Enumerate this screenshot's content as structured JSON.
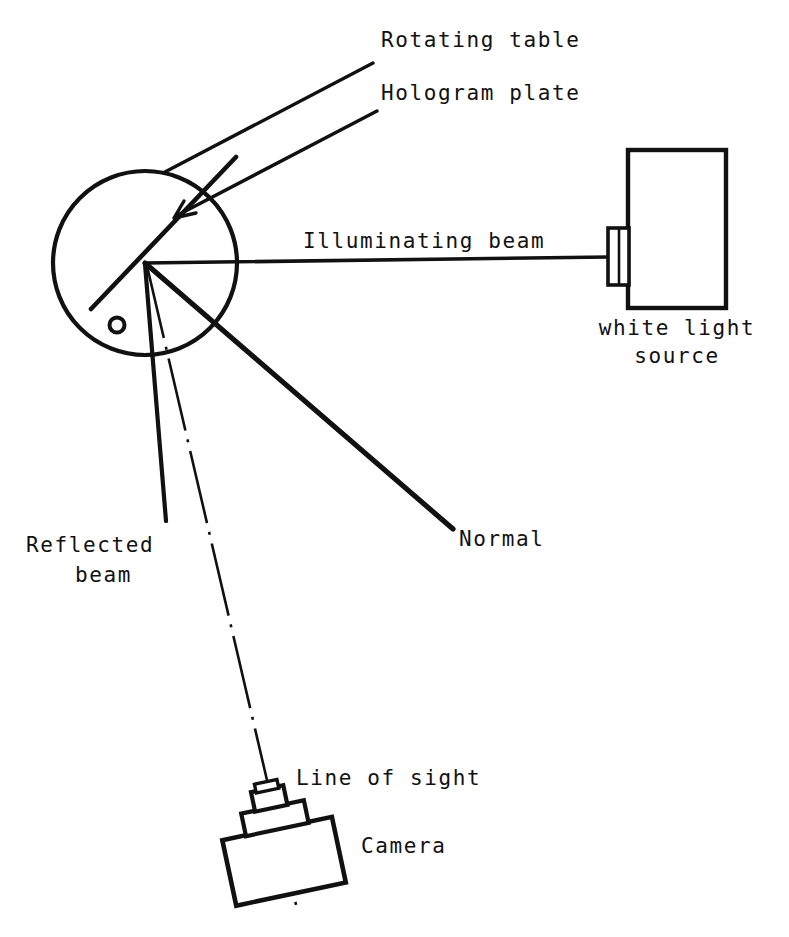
{
  "figure": {
    "kind": "optical-setup-diagram",
    "background_color": "#ffffff",
    "ink_color": "#111111"
  },
  "labels": {
    "rotating_table": "Rotating table",
    "hologram_plate": "Hologram plate",
    "illuminating_beam": "Illuminating beam",
    "white_light_source_line1": "white light",
    "white_light_source_line2": "source",
    "normal": "Normal",
    "reflected_beam_line1": "Reflected",
    "reflected_beam_line2": "beam",
    "line_of_sight": "Line of sight",
    "camera": "Camera"
  },
  "components": [
    {
      "id": "rotating-table",
      "name": "Rotating table",
      "shape": "circle"
    },
    {
      "id": "hologram-plate",
      "name": "Hologram plate",
      "shape": "line"
    },
    {
      "id": "pivot-marker",
      "name": "pivot marker",
      "shape": "small-circle"
    },
    {
      "id": "white-light-source",
      "name": "white light source",
      "shape": "rectangle-with-lens"
    },
    {
      "id": "camera",
      "name": "Camera",
      "shape": "tilted-box-with-lens"
    }
  ],
  "rays": [
    {
      "id": "illuminating-beam",
      "name": "Illuminating beam",
      "style": "solid",
      "weight": "medium"
    },
    {
      "id": "normal",
      "name": "Normal",
      "style": "solid",
      "weight": "heavy"
    },
    {
      "id": "reflected-beam",
      "name": "Reflected beam",
      "style": "solid",
      "weight": "medium"
    },
    {
      "id": "line-of-sight",
      "name": "Line of sight",
      "style": "dash-dot",
      "weight": "thin"
    }
  ],
  "geometry": {
    "table_center": [
      145,
      263
    ],
    "table_radius": 92,
    "pivot_marker": [
      117,
      325
    ],
    "source_box": [
      628,
      150,
      98,
      158
    ],
    "source_lens": [
      608,
      228,
      20,
      57
    ],
    "camera_center": [
      283,
      861
    ]
  }
}
